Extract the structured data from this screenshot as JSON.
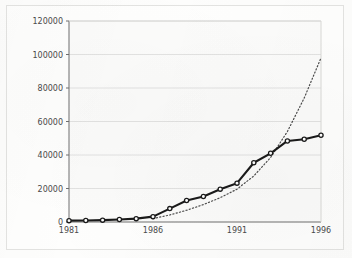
{
  "chart_data": {
    "type": "line",
    "title": "",
    "subtitle": "",
    "xlabel": "",
    "ylabel": "",
    "grid": true,
    "legend": "none",
    "xlim": [
      1981,
      1996
    ],
    "ylim": [
      0,
      120000
    ],
    "x": [
      1981,
      1982,
      1983,
      1984,
      1985,
      1986,
      1987,
      1988,
      1989,
      1990,
      1991,
      1992,
      1993,
      1994,
      1995,
      1996
    ],
    "xticks": [
      1981,
      1986,
      1991,
      1996
    ],
    "xtick_labels": [
      "1981",
      "1986",
      "1991",
      "1996"
    ],
    "yticks": [
      0,
      20000,
      40000,
      60000,
      80000,
      100000,
      120000
    ],
    "ytick_labels": [
      "0",
      "20000",
      "40000",
      "60000",
      "80000",
      "100000",
      "120000"
    ],
    "series": [
      {
        "name": "observed",
        "style": "solid",
        "marker": "open-circle",
        "color": "#1a1a1a",
        "values": [
          800,
          900,
          1100,
          1500,
          2000,
          3200,
          8000,
          12800,
          15200,
          19600,
          23200,
          35400,
          41000,
          48400,
          49400,
          51800
        ]
      },
      {
        "name": "trend",
        "style": "dotted",
        "marker": "none",
        "color": "#4d4d4d",
        "values": [
          null,
          null,
          null,
          null,
          null,
          2000,
          4200,
          7000,
          10400,
          14500,
          19600,
          27500,
          38500,
          54000,
          74000,
          98000
        ]
      }
    ]
  }
}
